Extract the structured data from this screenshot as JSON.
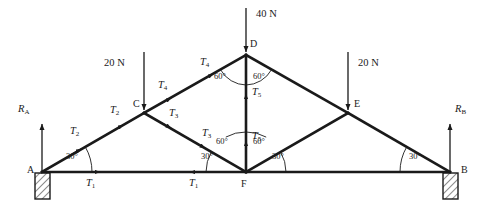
{
  "diagram": {
    "nodes": [
      {
        "id": "A",
        "label": "A",
        "x": 42,
        "y": 172
      },
      {
        "id": "B",
        "label": "B",
        "x": 450,
        "y": 172
      },
      {
        "id": "C",
        "label": "C",
        "x": 144,
        "y": 113
      },
      {
        "id": "D",
        "label": "D",
        "x": 246,
        "y": 55
      },
      {
        "id": "E",
        "label": "E",
        "x": 348,
        "y": 113
      },
      {
        "id": "F",
        "label": "F",
        "x": 246,
        "y": 172
      }
    ],
    "members": [
      {
        "name": "A-F",
        "from": "A",
        "to": "F"
      },
      {
        "name": "F-B",
        "from": "F",
        "to": "B"
      },
      {
        "name": "A-C",
        "from": "A",
        "to": "C"
      },
      {
        "name": "C-D",
        "from": "C",
        "to": "D"
      },
      {
        "name": "C-F",
        "from": "C",
        "to": "F"
      },
      {
        "name": "D-F",
        "from": "D",
        "to": "F"
      },
      {
        "name": "D-E",
        "from": "D",
        "to": "E"
      },
      {
        "name": "E-F",
        "from": "E",
        "to": "F"
      },
      {
        "name": "E-B",
        "from": "E",
        "to": "B"
      }
    ],
    "member_force_labels": [
      {
        "name": "T1-left",
        "text": "T",
        "sub": "1",
        "x": 86,
        "y": 182
      },
      {
        "name": "T1-right",
        "text": "T",
        "sub": "1",
        "x": 189,
        "y": 182
      },
      {
        "name": "T2-lower",
        "text": "T",
        "sub": "2",
        "x": 70,
        "y": 131
      },
      {
        "name": "T2-upper",
        "text": "T",
        "sub": "2",
        "x": 112,
        "y": 110
      },
      {
        "name": "T3-upper",
        "text": "T",
        "sub": "3",
        "x": 169,
        "y": 113
      },
      {
        "name": "T3-lower",
        "text": "T",
        "sub": "3",
        "x": 202,
        "y": 133
      },
      {
        "name": "T4-lower",
        "text": "T",
        "sub": "4",
        "x": 160,
        "y": 85
      },
      {
        "name": "T4-upper",
        "text": "T",
        "sub": "4",
        "x": 202,
        "y": 63
      },
      {
        "name": "T5-upper",
        "text": "T",
        "sub": "5",
        "x": 252,
        "y": 92
      },
      {
        "name": "T5-lower",
        "text": "T",
        "sub": "5",
        "x": 252,
        "y": 136
      }
    ],
    "loads": [
      {
        "name": "load-40N",
        "value": "40 N",
        "x_label": 256,
        "y_label": 14,
        "arrow_x": 246,
        "arrow_y1": 8,
        "arrow_y2": 52
      },
      {
        "name": "load-20N-left",
        "value": "20 N",
        "x_label": 104,
        "y_label": 63,
        "arrow_x": 144,
        "arrow_y1": 52,
        "arrow_y2": 110
      },
      {
        "name": "load-20N-right",
        "value": "20 N",
        "x_label": 358,
        "y_label": 63,
        "arrow_x": 348,
        "arrow_y1": 52,
        "arrow_y2": 110
      }
    ],
    "reactions": [
      {
        "name": "reaction-A",
        "text": "R",
        "sub": "A",
        "x_label": 21,
        "y_label": 110,
        "arrow_x": 42,
        "arrow_y1": 172,
        "arrow_y2": 124
      },
      {
        "name": "reaction-B",
        "text": "R",
        "sub": "B",
        "x_label": 455,
        "y_label": 110,
        "arrow_x": 450,
        "arrow_y1": 172,
        "arrow_y2": 124
      }
    ],
    "angles": [
      {
        "name": "angle-A-30",
        "value": "30°",
        "x": 66,
        "y": 157
      },
      {
        "name": "angle-F-left-30",
        "value": "30°",
        "x": 207,
        "y": 157
      },
      {
        "name": "angle-F-left-60",
        "value": "60°",
        "x": 219,
        "y": 142
      },
      {
        "name": "angle-F-right-60",
        "value": "60°",
        "x": 254,
        "y": 142
      },
      {
        "name": "angle-F-right-30",
        "value": "30°",
        "x": 270,
        "y": 157
      },
      {
        "name": "angle-B-30",
        "value": "30°",
        "x": 412,
        "y": 157
      },
      {
        "name": "angle-D-left-60",
        "value": "60°",
        "x": 219,
        "y": 76
      },
      {
        "name": "angle-D-right-60",
        "value": "60°",
        "x": 254,
        "y": 76
      }
    ],
    "supports": [
      {
        "name": "support-A",
        "x": 42,
        "y": 172
      },
      {
        "name": "support-B",
        "x": 450,
        "y": 172
      }
    ],
    "colors": {
      "line": "#1a1a1a",
      "text": "#1a1a1a",
      "thin_line": "#333333",
      "background": "#ffffff"
    }
  }
}
